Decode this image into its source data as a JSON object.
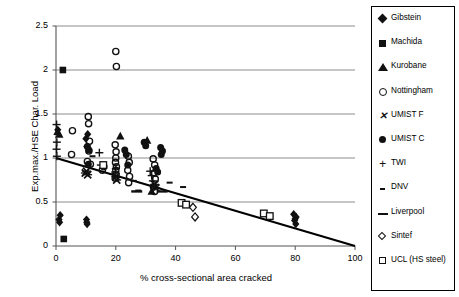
{
  "chart_data": {
    "type": "scatter",
    "title": "",
    "xlabel": "% cross-sectional area cracked",
    "ylabel": "Exp.max./HSE Char. Load",
    "xlim": [
      0,
      100
    ],
    "ylim": [
      0,
      2.5
    ],
    "xticks": [
      0,
      20,
      40,
      60,
      80,
      100
    ],
    "yticks": [
      0,
      0.5,
      1,
      1.5,
      2,
      2.5
    ],
    "xtick_labels": [
      "0",
      "20",
      "40",
      "60",
      "80",
      "100"
    ],
    "ytick_labels": [
      "0",
      "0.5",
      "1",
      "1.5",
      "2",
      "2.5"
    ],
    "grid": "horizontal",
    "legend_position": "right-outside",
    "trendline": {
      "label": "linear fit",
      "x": [
        0,
        100
      ],
      "y": [
        1.0,
        0.0
      ]
    },
    "series": [
      {
        "name": "Gibstein",
        "marker": "diamond-filled",
        "points": [
          [
            0.6,
            1.32
          ],
          [
            1.0,
            0.3
          ],
          [
            1.4,
            0.35
          ],
          [
            1.2,
            0.27
          ],
          [
            10.0,
            1.22
          ],
          [
            10.3,
            1.13
          ],
          [
            10.6,
            1.27
          ],
          [
            10.2,
            0.3
          ],
          [
            10.4,
            0.25
          ],
          [
            10.3,
            0.27
          ],
          [
            79.5,
            0.36
          ],
          [
            80.0,
            0.31
          ],
          [
            80.2,
            0.25
          ],
          [
            79.8,
            0.29
          ],
          [
            80.3,
            0.33
          ]
        ]
      },
      {
        "name": "Machida",
        "marker": "square-filled",
        "points": [
          [
            2.3,
            2.0
          ],
          [
            2.6,
            0.08
          ]
        ]
      },
      {
        "name": "Kurobane",
        "marker": "triangle-filled",
        "points": [
          [
            0.5,
            1.3
          ],
          [
            1.1,
            1.27
          ],
          [
            21.5,
            1.25
          ],
          [
            30.5,
            1.2
          ],
          [
            32.0,
            0.62
          ]
        ]
      },
      {
        "name": "Nottingham",
        "marker": "circle-open",
        "points": [
          [
            20.0,
            2.21
          ],
          [
            20.2,
            2.04
          ],
          [
            10.8,
            1.47
          ],
          [
            10.9,
            1.39
          ],
          [
            5.5,
            1.31
          ],
          [
            11.2,
            1.19
          ],
          [
            11.0,
            1.08
          ],
          [
            5.2,
            1.04
          ],
          [
            10.5,
            0.96
          ],
          [
            11.5,
            0.93
          ],
          [
            19.8,
            1.15
          ],
          [
            20.1,
            1.07
          ],
          [
            20.0,
            1.0
          ],
          [
            19.9,
            0.95
          ],
          [
            20.2,
            0.9
          ],
          [
            20.0,
            0.86
          ],
          [
            20.1,
            0.81
          ],
          [
            19.8,
            0.77
          ],
          [
            24.2,
            1.02
          ],
          [
            24.5,
            0.95
          ],
          [
            24.0,
            0.86
          ],
          [
            24.6,
            0.79
          ],
          [
            24.3,
            0.72
          ],
          [
            32.5,
            0.99
          ],
          [
            33.0,
            0.92
          ],
          [
            32.8,
            0.83
          ],
          [
            33.2,
            0.76
          ],
          [
            32.6,
            0.67
          ],
          [
            33.0,
            0.62
          ],
          [
            16.0,
            0.9
          ],
          [
            15.5,
            0.86
          ]
        ]
      },
      {
        "name": "UMIST F",
        "marker": "x-bold",
        "points": [
          [
            10.2,
            0.85
          ],
          [
            10.6,
            0.81
          ],
          [
            20.0,
            0.79
          ],
          [
            20.3,
            0.75
          ],
          [
            33.0,
            0.7
          ],
          [
            33.4,
            0.66
          ],
          [
            9.8,
            0.83
          ]
        ]
      },
      {
        "name": "UMIST C",
        "marker": "circle-filled",
        "points": [
          [
            10.5,
            1.13
          ],
          [
            11.0,
            1.09
          ],
          [
            23.0,
            1.09
          ],
          [
            23.5,
            1.04
          ],
          [
            29.5,
            1.18
          ],
          [
            30.0,
            1.14
          ],
          [
            35.0,
            1.12
          ],
          [
            35.6,
            1.08
          ],
          [
            35.2,
            1.04
          ],
          [
            24.0,
            0.92
          ],
          [
            33.5,
            0.88
          ],
          [
            34.0,
            0.84
          ],
          [
            10.8,
            0.93
          ]
        ]
      },
      {
        "name": "TWI",
        "marker": "plus",
        "points": [
          [
            0.2,
            1.38
          ],
          [
            0.3,
            1.18
          ],
          [
            0.2,
            1.1
          ],
          [
            0.3,
            1.02
          ],
          [
            14.5,
            1.06
          ],
          [
            15.0,
            0.92
          ],
          [
            20.0,
            0.88
          ],
          [
            19.8,
            0.84
          ],
          [
            31.5,
            0.85
          ],
          [
            32.0,
            0.8
          ],
          [
            32.4,
            0.74
          ]
        ]
      },
      {
        "name": "DNV",
        "marker": "dash-short",
        "points": [
          [
            12.2,
            1.02
          ],
          [
            26.0,
            0.74
          ],
          [
            27.5,
            0.63
          ],
          [
            38.0,
            0.72
          ],
          [
            42.5,
            0.67
          ]
        ]
      },
      {
        "name": "Liverpool",
        "marker": "dash-long",
        "points": [
          [
            27.0,
            0.62
          ],
          [
            35.5,
            0.62
          ]
        ]
      },
      {
        "name": "Sintef",
        "marker": "diamond-open",
        "points": [
          [
            45.8,
            0.44
          ],
          [
            46.5,
            0.33
          ]
        ]
      },
      {
        "name": "UCL (HS steel)",
        "marker": "square-open",
        "points": [
          [
            15.8,
            0.92
          ],
          [
            42.0,
            0.49
          ],
          [
            43.5,
            0.47
          ],
          [
            69.5,
            0.37
          ],
          [
            71.5,
            0.34
          ]
        ]
      }
    ]
  },
  "legend": {
    "items": [
      {
        "label": "Gibstein",
        "marker": "diamond-filled"
      },
      {
        "label": "Machida",
        "marker": "square-filled"
      },
      {
        "label": "Kurobane",
        "marker": "triangle-filled"
      },
      {
        "label": "Nottingham",
        "marker": "circle-open"
      },
      {
        "label": "UMIST F",
        "marker": "x-bold"
      },
      {
        "label": "UMIST C",
        "marker": "circle-filled"
      },
      {
        "label": "TWI",
        "marker": "plus"
      },
      {
        "label": "DNV",
        "marker": "dash-short"
      },
      {
        "label": "Liverpool",
        "marker": "dash-long"
      },
      {
        "label": "Sintef",
        "marker": "diamond-open"
      },
      {
        "label": "UCL (HS steel)",
        "marker": "square-open"
      }
    ]
  },
  "colors": {
    "marker": "#111111",
    "axis": "#555555",
    "grid": "#808080",
    "trendline": "#000000",
    "background": "#ffffff"
  }
}
